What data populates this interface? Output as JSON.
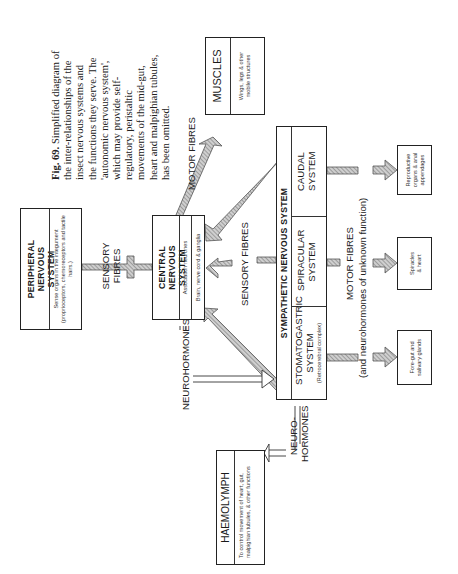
{
  "caption": {
    "fig_label": "Fig. 69.",
    "text": "Simplified diagram of the inter-relationships of the insect nervous systems and the functions they serve. The 'autonomic nervous system', which may provide self-regulatory, peristaltic movements of the mid-gut, heart and malpighian tubules, has been omitted."
  },
  "boxes": {
    "peripheral": {
      "title": "PERIPHERAL NERVOUS SYSTEM",
      "desc": "Sense organs in the integument (proprioceptors, chemoreceptors and tactile hairs.)"
    },
    "central": {
      "title": "CENTRAL NERVOUS SYSTEM",
      "sub1": "Association neurones",
      "sub2": "Brain, nerve cord & ganglia"
    },
    "muscles": {
      "title": "MUSCLES",
      "desc": "Wings, legs & other mobile structures"
    },
    "sympathetic": {
      "title": "SYMPATHETIC NERVOUS SYSTEM",
      "stomatogastric": {
        "title": "STOMATOGASTRIC SYSTEM",
        "desc": "(Retrocerebral complex)"
      },
      "spiracular": {
        "title": "SPIRACULAR SYSTEM"
      },
      "caudal": {
        "title": "CAUDAL SYSTEM"
      }
    },
    "reproductive": {
      "desc": "Reproductive organs & anal appendages"
    },
    "spiracles": {
      "desc": "Spiracles & heart"
    },
    "foregut": {
      "desc": "Fore-gut and salivary glands"
    },
    "haemolymph": {
      "title": "HAEMOLYMPH",
      "desc": "To control movement of heart, gut, malpighian tubules, & other functions"
    }
  },
  "labels": {
    "sensory_fibres_1": "SENSORY FIBRES",
    "sensory_fibres_2": "SENSORY FIBRES",
    "motor_fibres_1": "MOTOR FIBRES",
    "motor_fibres_2": "MOTOR FIBRES",
    "unknown_function": "(and neurohormones of unknown function)",
    "neurohormones_1": "NEUROHORMONES",
    "neurohormones_2": "NEURO-HORMONES"
  },
  "colors": {
    "line": "#222222",
    "hatch": "#9a9a9a",
    "background": "#ffffff"
  }
}
